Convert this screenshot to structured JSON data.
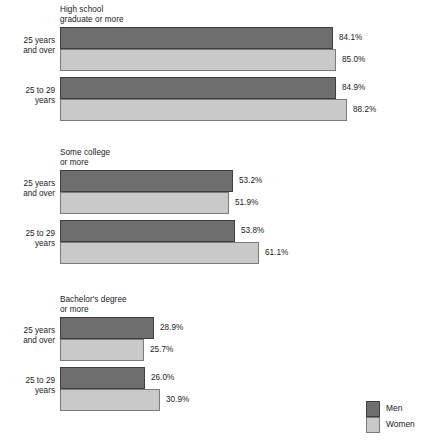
{
  "chart_data": {
    "type": "bar",
    "orientation": "horizontal",
    "title": "",
    "xlabel": "",
    "ylabel": "",
    "xlim": [
      0,
      100
    ],
    "grid": false,
    "legend_position": "bottom-right",
    "legend": [
      {
        "name": "Men",
        "color": "#6e6e6e"
      },
      {
        "name": "Women",
        "color": "#c9c9c9"
      }
    ],
    "series": [
      {
        "name": "Men",
        "color": "#6e6e6e"
      },
      {
        "name": "Women",
        "color": "#c9c9c9"
      }
    ],
    "groups": [
      {
        "title": "High school\ngraduate or more",
        "rows": [
          {
            "category": "25 years\nand over",
            "bars": [
              {
                "series": "Men",
                "value": 84.1,
                "label": "84.1%"
              },
              {
                "series": "Women",
                "value": 85.0,
                "label": "85.0%"
              }
            ]
          },
          {
            "category": "25 to 29\nyears",
            "bars": [
              {
                "series": "Men",
                "value": 84.9,
                "label": "84.9%"
              },
              {
                "series": "Women",
                "value": 88.2,
                "label": "88.2%"
              }
            ]
          }
        ]
      },
      {
        "title": "Some college\nor more",
        "rows": [
          {
            "category": "25 years\nand over",
            "bars": [
              {
                "series": "Men",
                "value": 53.2,
                "label": "53.2%"
              },
              {
                "series": "Women",
                "value": 51.9,
                "label": "51.9%"
              }
            ]
          },
          {
            "category": "25 to 29\nyears",
            "bars": [
              {
                "series": "Men",
                "value": 53.8,
                "label": "53.8%"
              },
              {
                "series": "Women",
                "value": 61.1,
                "label": "61.1%"
              }
            ]
          }
        ]
      },
      {
        "title": "Bachelor's degree\nor more",
        "rows": [
          {
            "category": "25 years\nand over",
            "bars": [
              {
                "series": "Men",
                "value": 28.9,
                "label": "28.9%"
              },
              {
                "series": "Women",
                "value": 25.7,
                "label": "25.7%"
              }
            ]
          },
          {
            "category": "25 to 29\nyears",
            "bars": [
              {
                "series": "Men",
                "value": 26.0,
                "label": "26.0%"
              },
              {
                "series": "Women",
                "value": 30.9,
                "label": "30.9%"
              }
            ]
          }
        ]
      }
    ]
  },
  "layout": {
    "bar_origin_x": 60,
    "bar_max_width": 325,
    "bar_height": 22,
    "group_tops": [
      5,
      148,
      295
    ],
    "group_title_height": 22,
    "pair_gap": 6
  }
}
